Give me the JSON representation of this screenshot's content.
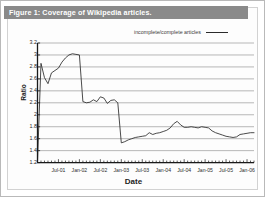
{
  "figure": {
    "caption": "Figure 1: Coverage of Wikipedia articles.",
    "caption_bar_color": "#8a8a8a",
    "caption_text_color": "#ffffff",
    "background": "#ffffff",
    "frame_color": "#b9b9b9"
  },
  "legend": {
    "position": "top-right",
    "entries": [
      {
        "label": "incomplete/complete articles",
        "color": "#2b2b2b",
        "style": "line"
      }
    ]
  },
  "axes": {
    "ylabel": "Ratio",
    "xlabel": "Date",
    "ytick_labels": [
      "3.2",
      "3",
      "2.8",
      "2.6",
      "2.4",
      "2.2",
      "2",
      "1.8",
      "1.6",
      "1.4",
      "1.2"
    ],
    "xtick_labels": [
      "Jul-01",
      "Jan-02",
      "Jul-02",
      "Jan-03",
      "Jul-03",
      "Jan-04",
      "Jul-04",
      "Jan-05",
      "Jul-05",
      "Jan-06"
    ],
    "gridline_color": "#999999",
    "axis_color": "#1a1a1a"
  },
  "chart_data": {
    "type": "line",
    "title": "Figure 1: Coverage of Wikipedia articles.",
    "xlabel": "Date",
    "ylabel": "Ratio",
    "ylim": [
      1.2,
      3.2
    ],
    "ytick_step": 0.2,
    "grid": true,
    "legend_position": "top-right",
    "xlim": [
      "Jan-01",
      "Mar-06"
    ],
    "series": [
      {
        "name": "incomplete/complete articles",
        "color": "#2b2b2b",
        "x": [
          "Jan-01",
          "Feb-01",
          "Mar-01",
          "Apr-01",
          "May-01",
          "Jun-01",
          "Jul-01",
          "Aug-01",
          "Sep-01",
          "Oct-01",
          "Nov-01",
          "Dec-01",
          "Jan-02",
          "Feb-02",
          "Mar-02",
          "Apr-02",
          "May-02",
          "Jun-02",
          "Jul-02",
          "Aug-02",
          "Sep-02",
          "Oct-02",
          "Nov-02",
          "Dec-02",
          "Jan-03",
          "Feb-03",
          "Mar-03",
          "Apr-03",
          "May-03",
          "Jun-03",
          "Jul-03",
          "Aug-03",
          "Sep-03",
          "Oct-03",
          "Nov-03",
          "Dec-03",
          "Jan-04",
          "Feb-04",
          "Mar-04",
          "Apr-04",
          "May-04",
          "Jun-04",
          "Jul-04",
          "Aug-04",
          "Sep-04",
          "Oct-04",
          "Nov-04",
          "Dec-04",
          "Jan-05",
          "Feb-05",
          "Mar-05",
          "Apr-05",
          "May-05",
          "Jun-05",
          "Jul-05",
          "Aug-05",
          "Sep-05",
          "Oct-05",
          "Nov-05",
          "Dec-05",
          "Jan-06",
          "Feb-06",
          "Mar-06"
        ],
        "values": [
          1.22,
          2.86,
          2.62,
          2.52,
          2.7,
          2.74,
          2.78,
          2.88,
          2.95,
          3.0,
          3.02,
          3.01,
          3.0,
          2.22,
          2.2,
          2.21,
          2.25,
          2.22,
          2.3,
          2.28,
          2.19,
          2.24,
          2.25,
          2.2,
          1.53,
          1.55,
          1.58,
          1.6,
          1.62,
          1.63,
          1.64,
          1.65,
          1.7,
          1.67,
          1.69,
          1.7,
          1.72,
          1.74,
          1.78,
          1.85,
          1.89,
          1.83,
          1.79,
          1.79,
          1.8,
          1.79,
          1.78,
          1.8,
          1.79,
          1.78,
          1.73,
          1.7,
          1.68,
          1.66,
          1.64,
          1.63,
          1.62,
          1.63,
          1.67,
          1.68,
          1.69,
          1.7,
          1.7
        ]
      }
    ]
  }
}
